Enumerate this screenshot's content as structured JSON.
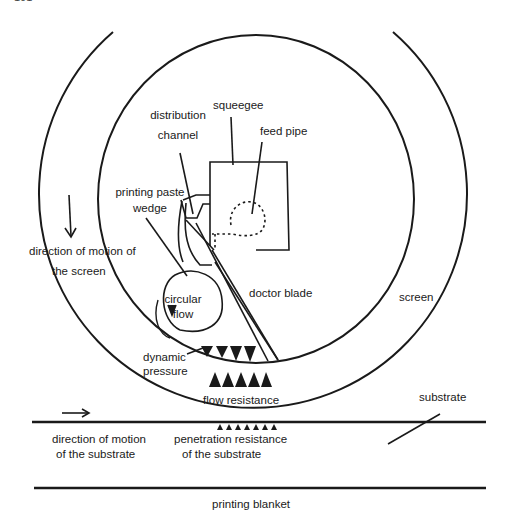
{
  "page": {
    "number": "101"
  },
  "labels": {
    "squeegee": "squeegee",
    "feed_pipe": "feed pipe",
    "distribution_channel_1": "distribution",
    "distribution_channel_2": "channel",
    "printing_paste_wedge_1": "printing paste",
    "printing_paste_wedge_2": "wedge",
    "screen_motion_1": "direction of motion of",
    "screen_motion_2": "the screen",
    "circular_flow_1": "circular",
    "circular_flow_2": "flow",
    "doctor_blade": "doctor blade",
    "screen": "screen",
    "dynamic_pressure_1": "dynamic",
    "dynamic_pressure_2": "pressure",
    "flow_resistance": "flow resistance",
    "substrate": "substrate",
    "substrate_motion_1": "direction of motion",
    "substrate_motion_2": "of the substrate",
    "penetration_1": "penetration resistance",
    "penetration_2": "of the substrate",
    "printing_blanket": "printing blanket"
  },
  "colors": {
    "ink": "#1a1a1a",
    "background": "#ffffff"
  }
}
